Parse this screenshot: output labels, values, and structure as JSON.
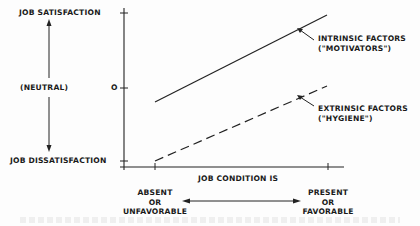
{
  "diagram": {
    "type": "two-factor line diagram",
    "y_axis": {
      "top_label": "JOB SATISFACTION",
      "middle_label": "(NEUTRAL)",
      "zero_tick": "O",
      "bottom_label": "JOB DISSATISFACTION"
    },
    "x_axis": {
      "title": "JOB CONDITION IS",
      "left_label": [
        "ABSENT",
        "OR",
        "UNFAVORABLE"
      ],
      "right_label": [
        "PRESENT",
        "OR",
        "FAVORABLE"
      ]
    },
    "series": [
      {
        "name": "INTRINSIC FACTORS",
        "subname": "(\"MOTIVATORS\")",
        "style": "solid",
        "from": "below neutral",
        "to": "near job satisfaction"
      },
      {
        "name": "EXTRINSIC FACTORS",
        "subname": "(\"HYGIENE\")",
        "style": "dashed",
        "from": "job dissatisfaction",
        "to": "slightly below neutral"
      }
    ]
  }
}
